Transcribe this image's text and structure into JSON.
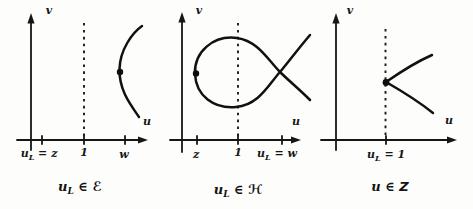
{
  "colors": {
    "background": "#fdfdfc",
    "ink": "#161616"
  },
  "panels": [
    {
      "id": "left-elliptic",
      "v_label": "v",
      "u_label": "u",
      "ticks": [
        {
          "base": "u",
          "sub": "L",
          "rest": " = z"
        },
        {
          "base": "1"
        },
        {
          "base": "w"
        }
      ],
      "caption": {
        "base": "u",
        "sub": "L",
        "rest": " ∈ ",
        "set": "ℰ"
      }
    },
    {
      "id": "middle-hyperbolic",
      "v_label": "v",
      "u_label": "u",
      "ticks": [
        {
          "base": "z"
        },
        {
          "base": "1"
        },
        {
          "base": "u",
          "sub": "L",
          "rest": " = w"
        }
      ],
      "caption": {
        "base": "u",
        "sub": "L",
        "rest": " ∈ ",
        "set": "ℋ"
      }
    },
    {
      "id": "right-boundary",
      "v_label": "v",
      "u_label": "u",
      "ticks": [
        {
          "base": "u",
          "sub": "L",
          "rest": " = 1"
        }
      ],
      "caption": {
        "base": "u",
        "rest": " ∈ ",
        "set": "Z"
      }
    }
  ]
}
